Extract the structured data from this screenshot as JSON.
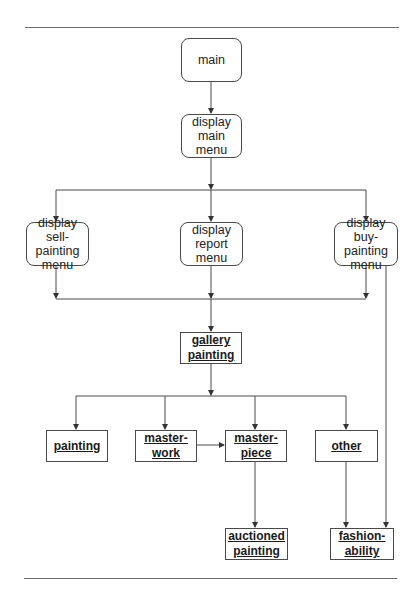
{
  "diagram": {
    "type": "structure-chart",
    "colors": {
      "line": "#4a4a4a",
      "rule": "#6b6b6b",
      "background": "#ffffff"
    },
    "nodes": {
      "main": {
        "label": "main",
        "kind": "process"
      },
      "display_main_menu": {
        "label": "display\nmain\nmenu",
        "kind": "process"
      },
      "display_sell_painting_menu": {
        "label": "display sell-\npainting\nmenu",
        "kind": "process"
      },
      "display_report_menu": {
        "label": "display\nreport\nmenu",
        "kind": "process"
      },
      "display_buy_painting_menu": {
        "label": "display buy-\npainting\nmenu",
        "kind": "process"
      },
      "gallery_painting": {
        "label": "gallery\npainting",
        "kind": "class"
      },
      "painting": {
        "label": "painting",
        "kind": "class"
      },
      "masterwork": {
        "label": "master-\nwork",
        "kind": "class"
      },
      "masterpiece": {
        "label": "master-\npiece",
        "kind": "class"
      },
      "other": {
        "label": "other",
        "kind": "class"
      },
      "auctioned_painting": {
        "label": "auctioned\npainting",
        "kind": "class"
      },
      "fashionability": {
        "label": "fashion-\nability",
        "kind": "class"
      }
    },
    "edges": [
      {
        "from": "main",
        "to": "display_main_menu"
      },
      {
        "from": "display_main_menu",
        "to": "display_sell_painting_menu"
      },
      {
        "from": "display_main_menu",
        "to": "display_report_menu"
      },
      {
        "from": "display_main_menu",
        "to": "display_buy_painting_menu"
      },
      {
        "from": "display_sell_painting_menu",
        "to": "gallery_painting"
      },
      {
        "from": "display_report_menu",
        "to": "gallery_painting"
      },
      {
        "from": "display_buy_painting_menu",
        "to": "gallery_painting"
      },
      {
        "from": "display_buy_painting_menu",
        "to": "fashionability"
      },
      {
        "from": "gallery_painting",
        "to": "painting"
      },
      {
        "from": "gallery_painting",
        "to": "masterwork"
      },
      {
        "from": "gallery_painting",
        "to": "masterpiece"
      },
      {
        "from": "gallery_painting",
        "to": "other"
      },
      {
        "from": "masterwork",
        "to": "masterpiece"
      },
      {
        "from": "masterpiece",
        "to": "auctioned_painting"
      },
      {
        "from": "other",
        "to": "fashionability"
      }
    ]
  }
}
